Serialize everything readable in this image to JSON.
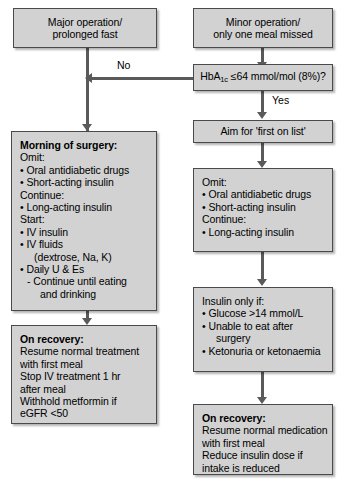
{
  "diagram": {
    "box_fill_color": "#d2d2d2",
    "box_border_color": "#4a4a4a",
    "connector_color": "#5a5a5a",
    "background_color": "#ffffff"
  },
  "nodes": {
    "major_operation": {
      "line1": "Major operation/",
      "line2": "prolonged fast"
    },
    "minor_operation": {
      "line1": "Minor operation/",
      "line2": "only one meal missed"
    },
    "hba1c_decision": {
      "prefix": "HbA",
      "subscript": "1c",
      "suffix": " ≤64 mmol/mol (8%)?"
    },
    "aim_first_on_list": {
      "text": "Aim for 'first on list'"
    },
    "morning_of_surgery": {
      "lines": [
        "Morning of surgery:",
        "Omit:",
        "Oral antidiabetic drugs",
        "Short-acting insulin",
        "Continue:",
        "Long-acting insulin",
        "Start:",
        "IV insulin",
        "IV fluids",
        "(dextrose, Na, K)",
        "Daily U & Es",
        "Continue until eating",
        "and drinking"
      ]
    },
    "left_on_recovery": {
      "lines": [
        "On recovery:",
        "Resume normal treatment",
        "with first meal",
        "Stop IV treatment 1 hr",
        "after meal",
        "Withhold metformin if",
        "eGFR <50"
      ]
    },
    "right_omit": {
      "lines": [
        "Omit:",
        "Oral antidiabetic drugs",
        "Short-acting insulin",
        "Continue:",
        "Long-acting insulin"
      ]
    },
    "insulin_only_if": {
      "lines": [
        "Insulin only if:",
        "Glucose >14 mmol/L",
        "Unable to eat after",
        "surgery",
        "Ketonuria or ketonaemia"
      ]
    },
    "right_on_recovery": {
      "lines": [
        "On recovery:",
        "Resume normal medication",
        "with first meal",
        "Reduce insulin dose if",
        "intake is reduced"
      ]
    }
  },
  "edges": {
    "no_label": "No",
    "yes_label": "Yes"
  }
}
